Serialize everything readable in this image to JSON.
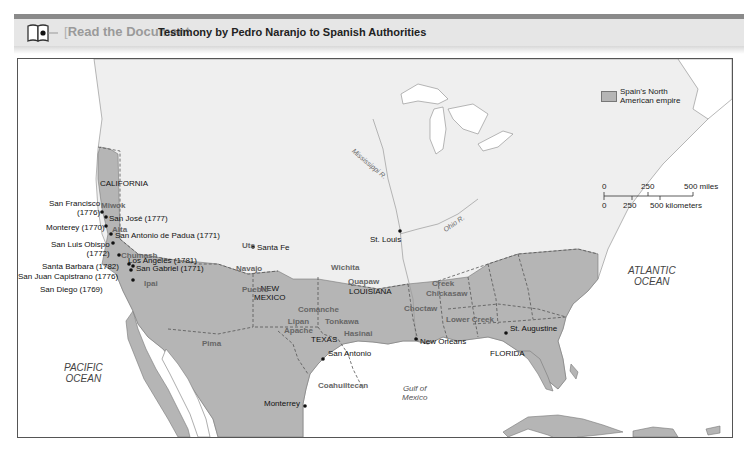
{
  "header": {
    "section_label_prefix": "Read",
    "section_label_rest": " the Document",
    "document_title": "Testimony by Pedro Naranjo to Spanish Authorities",
    "icon": "book-icon"
  },
  "legend": {
    "empire_label_line1": "Spain's North",
    "empire_label_line2": "American empire",
    "empire_color": "#b5b5b5",
    "scale_miles": [
      "0",
      "250",
      "500 miles"
    ],
    "scale_km": [
      "0",
      "250",
      "500 kilometers"
    ]
  },
  "regions": {
    "california": "CALIFORNIA",
    "new_mexico_1": "NEW",
    "new_mexico_2": "MEXICO",
    "louisiana": "LOUISIANA",
    "texas": "TEXAS",
    "florida": "FLORIDA"
  },
  "tribes": {
    "miwok": "Miwok",
    "alta": "Alta",
    "chumash": "Chumash",
    "ipai": "Ipai",
    "ute": "Ute",
    "navajo": "Navajo",
    "pueblo": "Pueblo",
    "wichita": "Wichita",
    "quapaw": "Quapaw",
    "comanche": "Comanche",
    "lipan_1": "Lipan",
    "lipan_2": "Apache",
    "tonkawa": "Tonkawa",
    "hasinai": "Hasinai",
    "pima": "Pima",
    "coahuiltecan": "Coahuiltecan",
    "creek": "Creek",
    "chickasaw": "Chickasaw",
    "choctaw": "Choctaw",
    "lower_creek": "Lower Creek"
  },
  "settlements": {
    "san_francisco_1": "San Francisco",
    "san_francisco_2": "(1776)",
    "san_jose": "San José (1777)",
    "monterey_ca": "Monterey (1770)",
    "san_antonio_padua": "San Antonio de Padua (1771)",
    "san_luis_obispo_1": "San Luis Obispo",
    "san_luis_obispo_2": "(1772)",
    "santa_barbara": "Santa Barbara (1782)",
    "los_angeles": "Los Angeles (1781)",
    "san_gabriel": "San Gabriel (1771)",
    "san_juan_capistrano": "San Juan Capistrano (1776)",
    "san_diego": "San Diego (1769)",
    "santa_fe": "Santa Fe",
    "st_louis": "St. Louis",
    "san_antonio": "San Antonio",
    "new_orleans": "New Orleans",
    "st_augustine": "St. Augustine",
    "monterrey_mx": "Monterrey"
  },
  "water": {
    "pacific_1": "PACIFIC",
    "pacific_2": "OCEAN",
    "atlantic_1": "ATLANTIC",
    "atlantic_2": "OCEAN",
    "gulf_1": "Gulf of",
    "gulf_2": "Mexico",
    "mississippi": "Mississippi R.",
    "ohio": "Ohio R."
  }
}
